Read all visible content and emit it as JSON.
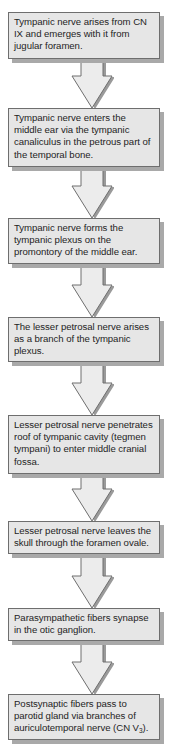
{
  "diagram": {
    "type": "vertical flowchart",
    "colors": {
      "box_fill": "#e6e6e6",
      "box_border": "#6e6e6e",
      "box_shadow": "#a9a9a9",
      "arrow_fill": "#ececec",
      "arrow_outline": "#6e6e6e",
      "text": "#1e1e1e"
    },
    "steps": [
      {
        "text": "Tympanic nerve arises from CN IX and emerges with it from jugular foramen."
      },
      {
        "text": "Tympanic nerve enters the middle ear via the tympanic canaliculus in the petrous part of the temporal bone."
      },
      {
        "text": "Tympanic nerve forms the tympanic plexus on the promontory of the middle ear."
      },
      {
        "text": "The lesser petrosal nerve arises as a branch of the tympanic plexus."
      },
      {
        "text": "Lesser petrosal nerve penetrates roof of tympanic cavity (tegmen tympani) to enter middle cranial fossa."
      },
      {
        "text": "Lesser petrosal nerve leaves the skull through the foramen ovale."
      },
      {
        "text": "Parasympathetic fibers synapse in the otic ganglion."
      },
      {
        "text_main": "Postsynaptic fibers pass to parotid gland via branches of auriculotemporal nerve (CN V",
        "subscript": "3",
        "text_end": ")."
      }
    ],
    "arrows": [
      {
        "from": 1,
        "to": 2,
        "icon": "down-arrow-icon"
      },
      {
        "from": 2,
        "to": 3,
        "icon": "down-arrow-icon"
      },
      {
        "from": 3,
        "to": 4,
        "icon": "down-arrow-icon"
      },
      {
        "from": 4,
        "to": 5,
        "icon": "down-arrow-icon"
      },
      {
        "from": 5,
        "to": 6,
        "icon": "down-arrow-icon"
      },
      {
        "from": 6,
        "to": 7,
        "icon": "down-arrow-icon"
      },
      {
        "from": 7,
        "to": 8,
        "icon": "down-arrow-icon"
      }
    ]
  }
}
